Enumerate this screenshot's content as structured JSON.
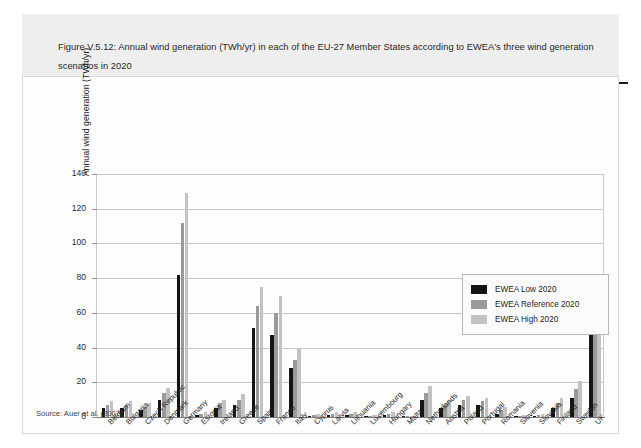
{
  "caption": {
    "text": "Figure V.5.12: Annual wind generation (TWh/yr) in each of the EU-27 Member States according to EWEA's three wind generation scenarios in 2020"
  },
  "source": {
    "text": "Source: Auer et al. (2007)"
  },
  "colors": {
    "low": "#141414",
    "reference": "#9a9a9a",
    "high": "#c2c2c2",
    "caption_band": "#eeeeee",
    "grid": "#c7c7c7"
  },
  "chart_data": {
    "type": "bar",
    "title": "Figure V.5.12: Annual wind generation (TWh/yr) in each of the EU-27 Member States according to EWEA's three wind generation scenarios in 2020",
    "xlabel": "",
    "ylabel": "Annual wind generation (TWh/yr)",
    "ylim": [
      0,
      140
    ],
    "yticks": [
      0,
      20,
      40,
      60,
      80,
      100,
      120,
      140
    ],
    "grid": true,
    "legend_position": "upper right",
    "categories": [
      "Belgium",
      "Bulgaria",
      "Czech Republic",
      "Denmark",
      "Germany",
      "Estonia",
      "Ireland",
      "Greece",
      "Spain",
      "France",
      "Italy",
      "Cyprus",
      "Latvia",
      "Lithuania",
      "Luxembourg",
      "Hungary",
      "Malta",
      "Netherlands",
      "Austria",
      "Poland",
      "Portugal",
      "Romania",
      "Slovenia",
      "Slovakia",
      "Finland",
      "Sweden",
      "UK"
    ],
    "series": [
      {
        "name": "EWEA Low 2020",
        "color": "#141414",
        "values": [
          5,
          5,
          4,
          10,
          82,
          1,
          5,
          7,
          51,
          47,
          28,
          0.6,
          1,
          1,
          0.4,
          1,
          0.2,
          10,
          5,
          7,
          7,
          2,
          0.3,
          0.5,
          5,
          11,
          48
        ]
      },
      {
        "name": "EWEA Reference 2020",
        "color": "#9a9a9a",
        "values": [
          7,
          7,
          6,
          14,
          112,
          2,
          8,
          10,
          64,
          60,
          33,
          1,
          2,
          2,
          0.8,
          2,
          0.4,
          14,
          7,
          10,
          9,
          4,
          0.6,
          1,
          8,
          16,
          68
        ]
      },
      {
        "name": "EWEA High 2020",
        "color": "#c2c2c2",
        "values": [
          9,
          9,
          8,
          17,
          129,
          3,
          10,
          13,
          75,
          70,
          40,
          1.5,
          3,
          3,
          1.2,
          3,
          0.6,
          18,
          9,
          12,
          11,
          6,
          1,
          1.5,
          11,
          21,
          78
        ]
      }
    ]
  }
}
